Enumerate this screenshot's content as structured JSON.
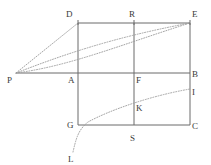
{
  "figure": {
    "width": 211,
    "height": 165,
    "background_color": "#ffffff",
    "solid_line_color": "#6b6b6b",
    "dotted_line_color": "#9a9a9a",
    "label_color": "#3a3a3a"
  },
  "points": [
    {
      "id": "P",
      "label": "P",
      "x": 16,
      "y": 73,
      "label_x": 7,
      "label_y": 76
    },
    {
      "id": "D",
      "label": "D",
      "x": 78,
      "y": 23,
      "label_x": 66,
      "label_y": 10
    },
    {
      "id": "R",
      "label": "R",
      "x": 134,
      "y": 23,
      "label_x": 129,
      "label_y": 10
    },
    {
      "id": "E",
      "label": "E",
      "x": 190,
      "y": 23,
      "label_x": 192,
      "label_y": 10
    },
    {
      "id": "A",
      "label": "A",
      "x": 78,
      "y": 73,
      "label_x": 68,
      "label_y": 76
    },
    {
      "id": "F",
      "label": "F",
      "x": 134,
      "y": 73,
      "label_x": 136,
      "label_y": 76
    },
    {
      "id": "B",
      "label": "B",
      "x": 190,
      "y": 73,
      "label_x": 192,
      "label_y": 70
    },
    {
      "id": "I",
      "label": "I",
      "x": 190,
      "y": 89,
      "label_x": 192,
      "label_y": 88
    },
    {
      "id": "K",
      "label": "K",
      "x": 134,
      "y": 101,
      "label_x": 136,
      "label_y": 104
    },
    {
      "id": "G",
      "label": "G",
      "x": 78,
      "y": 125,
      "label_x": 67,
      "label_y": 121
    },
    {
      "id": "S",
      "label": "S",
      "x": 134,
      "y": 125,
      "label_x": 130,
      "label_y": 134
    },
    {
      "id": "C",
      "label": "C",
      "x": 190,
      "y": 125,
      "label_x": 192,
      "label_y": 122
    },
    {
      "id": "L",
      "label": "L",
      "x": 73,
      "y": 152,
      "label_x": 68,
      "label_y": 155
    }
  ],
  "segments": [
    {
      "name": "rect-top-DE",
      "from": "D",
      "to": "E",
      "style": "solid"
    },
    {
      "name": "rect-bottom-GC",
      "from": "G",
      "to": "C",
      "style": "solid"
    },
    {
      "name": "rect-left-DG",
      "from": "D",
      "to": "G",
      "style": "solid"
    },
    {
      "name": "rect-right-EC",
      "from": "E",
      "to": "C",
      "style": "solid"
    },
    {
      "name": "axis-horizontal-PB",
      "from": "P",
      "to": "B",
      "style": "solid"
    },
    {
      "name": "axis-vertical-RS",
      "from": "R",
      "to": "S",
      "style": "solid"
    },
    {
      "name": "ray-P-to-D",
      "from": "P",
      "to": "D",
      "style": "dotted"
    }
  ],
  "curves": [
    {
      "name": "upper-curve-P-to-E",
      "style": "dotted",
      "path": "M 16,73 C 60,56 110,38 190,23"
    },
    {
      "name": "middle-curve-P-to-E",
      "style": "dotted",
      "path": "M 16,73 C 70,66 120,45 190,23"
    },
    {
      "name": "lower-curve-L-to-I",
      "style": "dotted",
      "path": "M 73,152 C 76,139 78,130 88,122 C 110,110 150,96 190,89"
    }
  ],
  "tick_marks": [
    {
      "name": "tick-D-top",
      "x": 78,
      "y": 23
    },
    {
      "name": "tick-R-top",
      "x": 134,
      "y": 23
    },
    {
      "name": "tick-E-top",
      "x": 190,
      "y": 23
    }
  ]
}
